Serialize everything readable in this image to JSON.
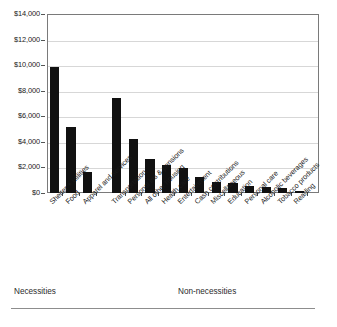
{
  "chart_data": {
    "type": "bar",
    "title": "",
    "subtitle": "",
    "xlabel": "",
    "ylabel": "",
    "ylim": [
      0,
      14000
    ],
    "ytick_values": [
      0,
      2000,
      4000,
      6000,
      8000,
      10000,
      12000,
      14000
    ],
    "ytick_labels": [
      "$0",
      "$2,000",
      "$4,000",
      "$6,000",
      "$8,000",
      "$10,000",
      "$12,000",
      "$14,000"
    ],
    "grid": true,
    "legend": "none",
    "bar_color": "#111111",
    "categories": [
      "Shelter + utilities",
      "Food",
      "Apparel and services",
      "Transportation",
      "Personal ins & pensions",
      "All other housing",
      "Health care",
      "Entertainment",
      "Cash contributions",
      "Miscellaneous",
      "Education",
      "Personal care",
      "Alcoholic beverages",
      "Tobacco products",
      "Reading"
    ],
    "values": [
      9850,
      5200,
      1650,
      7400,
      4200,
      2650,
      2200,
      1950,
      1250,
      850,
      800,
      580,
      470,
      380,
      120
    ],
    "groups": [
      {
        "label": "Necessities",
        "categories": [
          "Shelter + utilities",
          "Food",
          "Apparel and services"
        ]
      },
      {
        "label": "Non-necessities",
        "categories": [
          "Transportation",
          "Personal ins & pensions",
          "All other housing",
          "Health care",
          "Entertainment",
          "Cash contributions",
          "Miscellaneous",
          "Education",
          "Personal care",
          "Alcoholic beverages",
          "Tobacco products",
          "Reading"
        ]
      }
    ]
  },
  "footer": {
    "necessities_label": "Necessities",
    "non_necessities_label": "Non-necessities"
  }
}
